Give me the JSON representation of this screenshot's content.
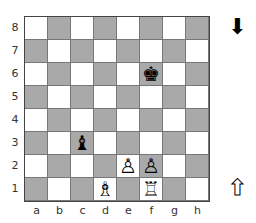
{
  "board": {
    "ranks": [
      "8",
      "7",
      "6",
      "5",
      "4",
      "3",
      "2",
      "1"
    ],
    "files": [
      "a",
      "b",
      "c",
      "d",
      "e",
      "f",
      "g",
      "h"
    ],
    "colors": {
      "light": "#ffffff",
      "dark": "#a9a9a9",
      "border": "#444444"
    },
    "pieces": [
      {
        "square": "f6",
        "type": "king",
        "color": "black",
        "glyph": "♚"
      },
      {
        "square": "c3",
        "type": "bishop",
        "color": "black",
        "glyph": "♝"
      },
      {
        "square": "e2",
        "type": "pawn",
        "color": "white",
        "glyph": "♙"
      },
      {
        "square": "f2",
        "type": "pawn",
        "color": "white",
        "glyph": "♙"
      },
      {
        "square": "d1",
        "type": "bishop",
        "color": "white",
        "glyph": "♗"
      },
      {
        "square": "f1",
        "type": "rook",
        "color": "white",
        "glyph": "♖"
      }
    ]
  },
  "indicators": {
    "black_side": {
      "icon": "arrow-down-filled",
      "glyph": "⬇"
    },
    "white_side": {
      "icon": "arrow-up-outline",
      "glyph": "⬆"
    }
  }
}
